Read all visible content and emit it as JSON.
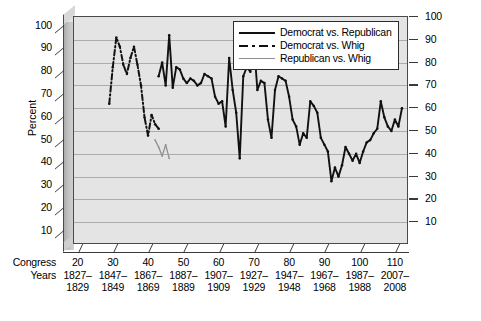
{
  "chart_data": {
    "type": "line",
    "title": "",
    "xlabel": "",
    "ylabel": "Percent",
    "ylim": [
      0,
      100
    ],
    "xlim": [
      17,
      112
    ],
    "grid": true,
    "legend_position": "top-right",
    "yticks": [
      10,
      20,
      30,
      40,
      50,
      60,
      70,
      80,
      90,
      100
    ],
    "yticks_right": [
      10,
      20,
      30,
      40,
      50,
      60,
      70,
      80,
      90,
      100
    ],
    "row_headers": [
      "Congress",
      "Years"
    ],
    "xticks": [
      {
        "congress": "20",
        "years_from": "1827–",
        "years_to": "1829"
      },
      {
        "congress": "30",
        "years_from": "1847–",
        "years_to": "1849"
      },
      {
        "congress": "40",
        "years_from": "1867–",
        "years_to": "1869"
      },
      {
        "congress": "50",
        "years_from": "1887–",
        "years_to": "1889"
      },
      {
        "congress": "60",
        "years_from": "1907–",
        "years_to": "1909"
      },
      {
        "congress": "70",
        "years_from": "1927–",
        "years_to": "1929"
      },
      {
        "congress": "80",
        "years_from": "1947–",
        "years_to": "1948"
      },
      {
        "congress": "90",
        "years_from": "1967–",
        "years_to": "1968"
      },
      {
        "congress": "100",
        "years_from": "1987–",
        "years_to": "1988"
      },
      {
        "congress": "110",
        "years_from": "2007–",
        "years_to": "2008"
      }
    ],
    "legend": [
      {
        "name": "Democrat vs. Republican",
        "style": "solid-thick",
        "color": "#111111"
      },
      {
        "name": "Democrat vs. Whig",
        "style": "dash-dot",
        "color": "#111111"
      },
      {
        "name": "Republican vs. Whig",
        "style": "solid-thin",
        "color": "#8f8f8f"
      }
    ],
    "series": [
      {
        "name": "Democrat vs. Whig",
        "style": "dash-dot",
        "color": "#111111",
        "x": [
          27,
          28,
          29,
          30,
          31,
          32,
          33,
          34,
          35,
          36,
          37,
          38,
          39,
          40,
          41
        ],
        "values": [
          62,
          78,
          91,
          87,
          79,
          75,
          82,
          87,
          79,
          70,
          56,
          48,
          57,
          53,
          51
        ]
      },
      {
        "name": "Republican vs. Whig",
        "style": "solid-thin",
        "color": "#8f8f8f",
        "x": [
          40,
          41,
          42,
          43,
          44
        ],
        "values": [
          46,
          43,
          39,
          44,
          38
        ]
      },
      {
        "name": "Democrat vs. Republican",
        "style": "solid-thick",
        "color": "#111111",
        "x": [
          41,
          42,
          43,
          44,
          45,
          46,
          47,
          48,
          49,
          50,
          51,
          52,
          53,
          54,
          55,
          56,
          57,
          58,
          59,
          60,
          61,
          62,
          63,
          64,
          65,
          66,
          67,
          68,
          69,
          70,
          71,
          72,
          73,
          74,
          75,
          76,
          77,
          78,
          79,
          80,
          81,
          82,
          83,
          84,
          85,
          86,
          87,
          88,
          89,
          90,
          91,
          92,
          93,
          94,
          95,
          96,
          97,
          98,
          99,
          100,
          101,
          102,
          103,
          104,
          105,
          106,
          107,
          108,
          109,
          110
        ],
        "values": [
          74,
          80,
          70,
          92,
          69,
          78,
          77,
          73,
          71,
          73,
          72,
          70,
          71,
          75,
          74,
          73,
          65,
          62,
          63,
          52,
          82,
          68,
          58,
          38,
          74,
          78,
          76,
          89,
          68,
          72,
          71,
          55,
          47,
          68,
          74,
          73,
          72,
          65,
          55,
          52,
          44,
          49,
          47,
          63,
          61,
          58,
          47,
          44,
          41,
          28,
          34,
          30,
          35,
          43,
          40,
          37,
          40,
          36,
          41,
          45,
          46,
          49,
          51,
          63,
          56,
          52,
          50,
          55,
          52,
          60
        ]
      }
    ]
  }
}
